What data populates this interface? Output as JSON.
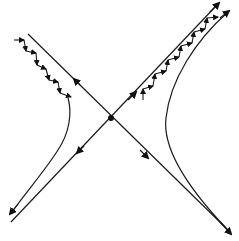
{
  "diagram": {
    "colors": {
      "stroke": "#1a1a1a",
      "background": "#ffffff"
    },
    "center_point": {
      "x": 111,
      "y": 118
    },
    "elements": [
      {
        "id": "asymptote-a",
        "type": "line",
        "from": [
          28,
          34
        ],
        "to": [
          230,
          232
        ],
        "arrows": [
          "toward-upper-left-midway",
          "toward-lower-right-end"
        ]
      },
      {
        "id": "asymptote-b",
        "type": "line",
        "from": [
          10,
          222
        ],
        "to": [
          219,
          4
        ],
        "arrows": [
          "toward-lower-left-midway",
          "toward-upper-right-end",
          "toward-upper-right-midway"
        ]
      },
      {
        "id": "hyperbola-left",
        "type": "curve",
        "arrow": "toward-lower-left-end"
      },
      {
        "id": "hyperbola-right",
        "type": "curve",
        "arrow": "toward-upper-right-end"
      },
      {
        "id": "zigzag-left",
        "type": "arrow-chain",
        "direction": "down-right"
      },
      {
        "id": "zigzag-right",
        "type": "arrow-chain",
        "direction": "up-right"
      }
    ]
  }
}
